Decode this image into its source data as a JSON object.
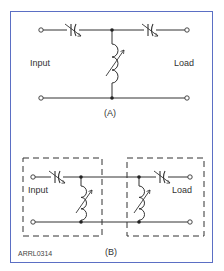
{
  "figure": {
    "id_label": "ARRL0314",
    "frame_color": "#5b6fc4",
    "line_color": "#333333"
  },
  "panel_a": {
    "caption": "(A)",
    "input_label": "Input",
    "load_label": "Load",
    "components": [
      "variable-capacitor",
      "variable-capacitor",
      "variable-inductor"
    ],
    "topology": "T-network"
  },
  "panel_b": {
    "caption": "(B)",
    "input_label": "Input",
    "load_label": "Load",
    "components": [
      "variable-capacitor",
      "variable-inductor",
      "variable-inductor",
      "variable-capacitor"
    ],
    "topology": "two L-networks (dashed boxes)"
  }
}
